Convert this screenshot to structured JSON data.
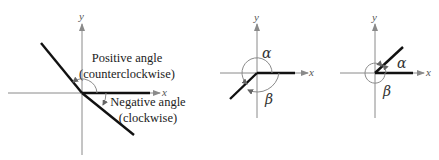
{
  "figures": [
    {
      "id": "positive-negative",
      "axis_labels": {
        "x": "x",
        "y": "y"
      },
      "annotations": {
        "positive_line1": "Positive angle",
        "positive_line2": "(counterclockwise)",
        "negative_line1": "Negative angle",
        "negative_line2": "(clockwise)"
      }
    },
    {
      "id": "coterminal-1",
      "axis_labels": {
        "x": "x",
        "y": "y"
      },
      "angles": {
        "alpha": "α",
        "beta": "β"
      }
    },
    {
      "id": "coterminal-2",
      "axis_labels": {
        "x": "x",
        "y": "y"
      },
      "angles": {
        "alpha": "α",
        "beta": "β"
      }
    }
  ],
  "colors": {
    "axis": "#8a8a8a",
    "ray": "#111111",
    "text": "#222222"
  }
}
